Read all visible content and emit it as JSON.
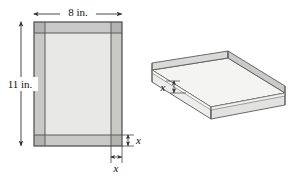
{
  "figure": {
    "flat_sheet": {
      "width_label": "8 in.",
      "height_label": "11 in.",
      "corner_cut_vertical_label": "x",
      "corner_cut_horizontal_label": "x",
      "sheet_width_in": 8,
      "sheet_height_in": 11,
      "corner_cut_variable": "x"
    },
    "box_3d": {
      "height_label": "x",
      "description": "open-top rectangular tray formed by folding up the flaps"
    },
    "colors": {
      "border_strip_fill": "#c8c8c8",
      "corner_square_fill": "#b4b4b4",
      "inner_panel_fill": "#e8e8e6",
      "box_face_light": "#f2f2f0",
      "box_face_mid": "#d8d8d6",
      "box_face_dark": "#c4c4c2",
      "outline": "#555555",
      "arrow": "#333333",
      "text": "#111111",
      "background": "#ffffff"
    }
  }
}
